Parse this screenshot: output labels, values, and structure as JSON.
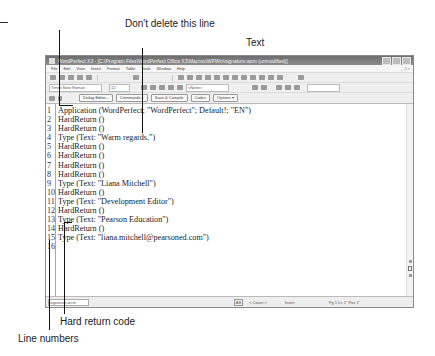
{
  "callouts": {
    "dont_delete": "Don't delete this line",
    "text": "Text",
    "hard_return": "Hard return code",
    "line_numbers": "Line numbers"
  },
  "window": {
    "title": "WordPerfect X3 - [C:\\Program Files\\WordPerfect Office X3\\Macros\\WPWin\\signature.wcm (unmodified)]",
    "controls": [
      "minimize",
      "maximize",
      "close"
    ],
    "doc_controls": "_ □ ×"
  },
  "menu": [
    "File",
    "Edit",
    "View",
    "Insert",
    "Format",
    "Table",
    "Tools",
    "Window",
    "Help"
  ],
  "property_bar": {
    "font": "Times New Roman",
    "size": "12",
    "style": "<None>"
  },
  "macro_bar": {
    "buttons": [
      "Dialog Editor...",
      "Commands...",
      "Save & Compile",
      "Codes",
      "Options ▾"
    ]
  },
  "code_lines": [
    {
      "num": "1",
      "text": "Application (WordPerfect; \"WordPerfect\"; Default!; \"EN\")"
    },
    {
      "num": "2",
      "text": "HardReturn ()"
    },
    {
      "num": "3",
      "text": "HardReturn ()"
    },
    {
      "num": "4",
      "text": "Type (Text: \"Warm regards,\")"
    },
    {
      "num": "5",
      "text": "HardReturn ()"
    },
    {
      "num": "6",
      "text": "HardReturn ()"
    },
    {
      "num": "7",
      "text": "HardReturn ()"
    },
    {
      "num": "8",
      "text": "HardReturn ()"
    },
    {
      "num": "9",
      "text": "Type (Text: \"Liana Mitchell\")"
    },
    {
      "num": "10",
      "text": "HardReturn ()"
    },
    {
      "num": "11",
      "text": "Type (Text: \"Development Editor\")"
    },
    {
      "num": "12",
      "text": "HardReturn ()"
    },
    {
      "num": "13",
      "text": "Type (Text: \"Pearson Education\")"
    },
    {
      "num": "14",
      "text": "HardReturn ()"
    },
    {
      "num": "15",
      "text": "Type (Text: \"liana.mitchell@pearsoned.com\")"
    },
    {
      "num": "16",
      "text": ""
    }
  ],
  "status_bar": {
    "app": "signature.wcm",
    "mode": "AB",
    "count": "< Count >",
    "insert": "Insert",
    "position": "Pg 1 Ln 1\" Pos 1\""
  }
}
